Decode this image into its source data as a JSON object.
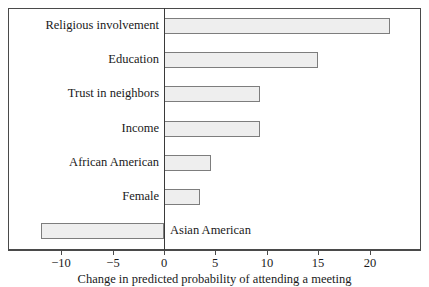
{
  "chart_data": {
    "type": "bar",
    "orientation": "horizontal",
    "title": "",
    "subtitle": "",
    "xlabel": "Change in predicted probability of attending a meeting",
    "ylabel": "",
    "xlim": [
      -13.5,
      25.2
    ],
    "ylim": [
      0,
      7
    ],
    "grid": false,
    "legend": null,
    "zero_reference_line": 0,
    "categories": [
      "Religious involvement",
      "Education",
      "Trust in neighbors",
      "Income",
      "African American",
      "Female",
      "Asian American"
    ],
    "values": [
      22,
      15,
      9.3,
      9.3,
      4.6,
      3.5,
      -12
    ],
    "xticks": [
      -10,
      -5,
      0,
      5,
      10,
      15,
      20
    ],
    "xtick_labels": [
      "−10",
      "−5",
      "0",
      "5",
      "10",
      "15",
      "20"
    ],
    "bars": [
      {
        "label": "Religious involvement",
        "value": 22,
        "label_side": "left"
      },
      {
        "label": "Education",
        "value": 15,
        "label_side": "left"
      },
      {
        "label": "Trust in neighbors",
        "value": 9.3,
        "label_side": "left"
      },
      {
        "label": "Income",
        "value": 9.3,
        "label_side": "left"
      },
      {
        "label": "African American",
        "value": 4.6,
        "label_side": "left"
      },
      {
        "label": "Female",
        "value": 3.5,
        "label_side": "left"
      },
      {
        "label": "Asian American",
        "value": -12,
        "label_side": "right"
      }
    ]
  },
  "style": {
    "bar_fill": "#eeeeee",
    "bar_stroke": "#7d7d7d",
    "frame_stroke": "#4a4a4a",
    "axis_stroke": "#4a4a4a",
    "zero_line": "#3a3a3a",
    "text_color": "#1a1a1a",
    "background": "#ffffff"
  },
  "axis": {
    "caption": "Change in predicted probability of attending a meeting",
    "ticks": [
      {
        "value": -10,
        "label": "−10"
      },
      {
        "value": -5,
        "label": "−5"
      },
      {
        "value": 0,
        "label": "0"
      },
      {
        "value": 5,
        "label": "5"
      },
      {
        "value": 10,
        "label": "10"
      },
      {
        "value": 15,
        "label": "15"
      },
      {
        "value": 20,
        "label": "20"
      }
    ]
  }
}
